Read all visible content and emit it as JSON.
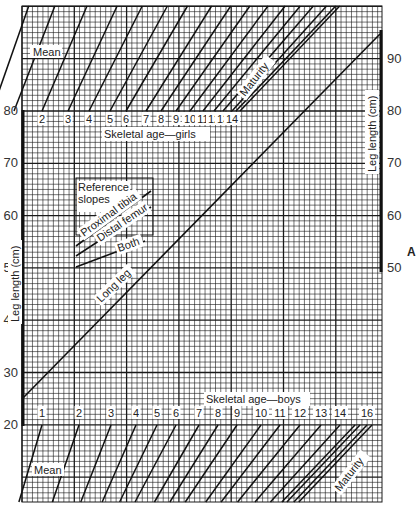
{
  "figure": {
    "panel_letter": "A",
    "left_axis_label": "Leg length (cm)",
    "right_axis_label": "Leg length (cm)",
    "girls_label": "Skeletal age—girls",
    "boys_label": "Skeletal age—boys",
    "mean_label": "Mean",
    "maturity_label": "Maturity",
    "long_leg_label": "Long leg",
    "reference_title_1": "Reference",
    "reference_title_2": "slopes",
    "ref_proximal_tibia": "Proximal tibia",
    "ref_distal_femur": "Distal femur",
    "ref_both": "Both",
    "colors": {
      "grid": "#1a1a1a",
      "ink": "#111111",
      "paper": "#ffffff",
      "label_bg": "#ffffff"
    }
  },
  "chart_data": {
    "type": "line",
    "ylabel": "Leg length (cm)",
    "left_axis": {
      "ticks": [
        20,
        30,
        40,
        50,
        60,
        70,
        80
      ],
      "ylim": [
        20,
        80
      ]
    },
    "right_axis": {
      "ticks": [
        50,
        60,
        70,
        80,
        90
      ],
      "ylim": [
        50,
        95
      ]
    },
    "grid": true,
    "girls_skeletal_age_ticks": [
      "2",
      "3",
      "4",
      "5",
      "6",
      "7",
      "8",
      "9",
      "10",
      "11",
      "12",
      "13",
      "14"
    ],
    "boys_skeletal_age_ticks": [
      "1",
      "2",
      "3",
      "4",
      "5",
      "6",
      "7",
      "8",
      "9",
      "10",
      "11",
      "12",
      "13",
      "14",
      "16"
    ],
    "series": [
      {
        "name": "Long leg",
        "points": [
          [
            0,
            25
          ],
          [
            1,
            95
          ]
        ],
        "note": "straight line rising from about 25 cm at the left edge to about 95 cm at the right edge"
      }
    ],
    "reference_slopes": [
      "Proximal tibia",
      "Distal femur",
      "Both"
    ],
    "annotations": [
      "Mean",
      "Maturity",
      "A"
    ]
  }
}
